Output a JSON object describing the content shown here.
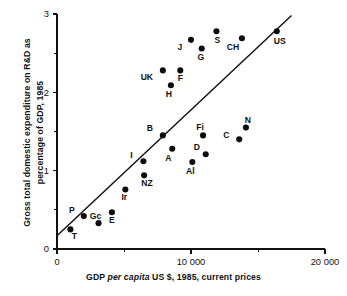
{
  "chart_data": {
    "type": "scatter",
    "title": "",
    "xlabel": "GDP per capita US $, 1985, current prices",
    "xlabel_parts": {
      "pre": "GDP ",
      "italic": "per capita",
      "post": " US $, 1985, current prices"
    },
    "ylabel": "Gross total domestic expenditure on R&D as percentage of GDP, 1985",
    "ylabel_line1": "Gross total domestic expenditure on R&D as",
    "ylabel_line2": "percentage of GDP, 1985",
    "xlim": [
      0,
      20000
    ],
    "ylim": [
      0,
      3
    ],
    "xticks": [
      0,
      10000,
      20000
    ],
    "xtick_labels": [
      "0",
      "10 000",
      "20 000"
    ],
    "xminor_ticks": [
      5000,
      15000
    ],
    "yticks": [
      0,
      1,
      2,
      3
    ],
    "ytick_labels": [
      "0",
      "1",
      "2",
      "3"
    ],
    "yminor_ticks": [
      0.5,
      1.5,
      2.5
    ],
    "grid": false,
    "legend": "none",
    "marker": "filled-circle",
    "marker_color": "#0d0d0d",
    "line_color": "#111111",
    "trend_line": {
      "label": "regression-line",
      "x_start": 0,
      "y_start": 0.17,
      "x_end": 17500,
      "y_end": 2.98
    },
    "points": [
      {
        "label": "T",
        "x": 1000,
        "y": 0.25,
        "label_dx": 4,
        "label_dy": 10
      },
      {
        "label": "P",
        "x": 2000,
        "y": 0.42,
        "label_dx": -12,
        "label_dy": -3
      },
      {
        "label": "Gc",
        "x": 3100,
        "y": 0.33,
        "label_dx": -3,
        "label_dy": -4
      },
      {
        "label": "E",
        "x": 4100,
        "y": 0.47,
        "label_dx": 0,
        "label_dy": 11
      },
      {
        "label": "Ir",
        "x": 5100,
        "y": 0.76,
        "label_dx": -1,
        "label_dy": 11
      },
      {
        "label": "NZ",
        "x": 6500,
        "y": 0.94,
        "label_dx": 3,
        "label_dy": 11
      },
      {
        "label": "I",
        "x": 6450,
        "y": 1.12,
        "label_dx": -12,
        "label_dy": -3
      },
      {
        "label": "B",
        "x": 7900,
        "y": 1.45,
        "label_dx": -13,
        "label_dy": -4
      },
      {
        "label": "A",
        "x": 8600,
        "y": 1.28,
        "label_dx": -4,
        "label_dy": 12
      },
      {
        "label": "Al",
        "x": 10100,
        "y": 1.11,
        "label_dx": -2,
        "label_dy": 12
      },
      {
        "label": "D",
        "x": 11100,
        "y": 1.21,
        "label_dx": -9,
        "label_dy": -4
      },
      {
        "label": "Fi",
        "x": 10900,
        "y": 1.45,
        "label_dx": -3,
        "label_dy": -5
      },
      {
        "label": "C",
        "x": 13600,
        "y": 1.4,
        "label_dx": -13,
        "label_dy": -1
      },
      {
        "label": "N",
        "x": 14100,
        "y": 1.55,
        "label_dx": 2,
        "label_dy": -5
      },
      {
        "label": "H",
        "x": 8500,
        "y": 2.09,
        "label_dx": -2,
        "label_dy": 12
      },
      {
        "label": "UK",
        "x": 7900,
        "y": 2.28,
        "label_dx": -16,
        "label_dy": 10
      },
      {
        "label": "F",
        "x": 9200,
        "y": 2.28,
        "label_dx": 0,
        "label_dy": 11
      },
      {
        "label": "J",
        "x": 10000,
        "y": 2.67,
        "label_dx": -11,
        "label_dy": 10
      },
      {
        "label": "G",
        "x": 10800,
        "y": 2.56,
        "label_dx": -1,
        "label_dy": 12
      },
      {
        "label": "S",
        "x": 11900,
        "y": 2.78,
        "label_dx": 1,
        "label_dy": 12
      },
      {
        "label": "CH",
        "x": 13800,
        "y": 2.69,
        "label_dx": -9,
        "label_dy": 12
      },
      {
        "label": "US",
        "x": 16400,
        "y": 2.78,
        "label_dx": 3,
        "label_dy": 13
      }
    ]
  }
}
